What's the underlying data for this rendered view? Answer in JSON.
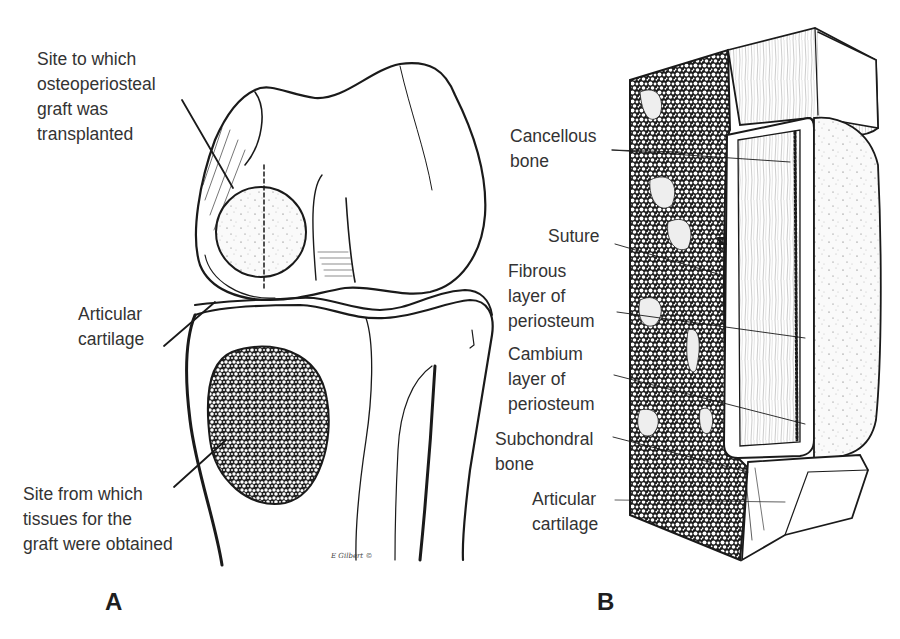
{
  "figure": {
    "panel_a": {
      "letter": "A",
      "labels": {
        "graft_site": [
          "Site to which",
          "osteoperiosteal",
          "graft was",
          "transplanted"
        ],
        "articular_cartilage": [
          "Articular",
          "cartilage"
        ],
        "donor_site": [
          "Site from which",
          "tissues for the",
          "graft were obtained"
        ]
      },
      "signature": "E Gilbert ©"
    },
    "panel_b": {
      "letter": "B",
      "labels": {
        "cancellous_bone": [
          "Cancellous",
          "bone"
        ],
        "suture": [
          "Suture"
        ],
        "fibrous_layer": [
          "Fibrous",
          "layer of",
          "periosteum"
        ],
        "cambium_layer": [
          "Cambium",
          "layer of",
          "periosteum"
        ],
        "subchondral_bone": [
          "Subchondral",
          "bone"
        ],
        "articular_cartilage": [
          "Articular",
          "cartilage"
        ]
      }
    }
  },
  "colors": {
    "ink": "#1a1a1a",
    "label_text": "#333333",
    "background": "#ffffff",
    "stipple": "#f1f1f1"
  }
}
